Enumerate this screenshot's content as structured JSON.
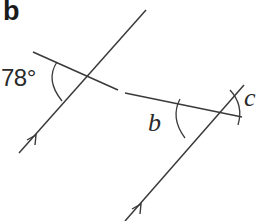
{
  "figure": {
    "part_label": "b",
    "angles": {
      "given": {
        "label": "78°",
        "value": 78
      },
      "unknown_b": {
        "label": "b"
      },
      "unknown_c": {
        "label": "c"
      }
    },
    "parallel_marker": "single arrow on each parallel line",
    "colors": {
      "line": "#3a3a3a",
      "text": "#2a2a2a",
      "background": "#ffffff"
    }
  }
}
